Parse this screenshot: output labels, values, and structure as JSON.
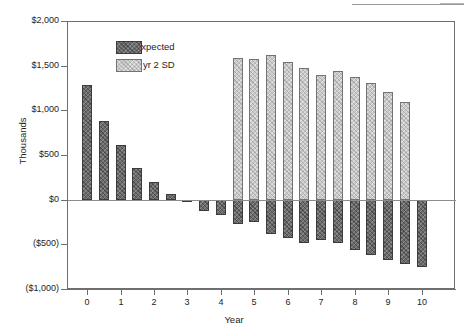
{
  "chart_data": {
    "type": "bar",
    "title": "",
    "xlabel": "Year",
    "ylabel": "Thousands",
    "ylim": [
      -1000,
      2000
    ],
    "xlim": [
      -0.6,
      11.0
    ],
    "grid": false,
    "legend_position": "top-left-inside",
    "y_ticks": [
      2000,
      1500,
      1000,
      500,
      0,
      -500,
      -1000
    ],
    "y_ticklabels": [
      "$2,000",
      "$1,500",
      "$1,000",
      "$500",
      "$0",
      "($500)",
      "($1,000)"
    ],
    "x_ticks": [
      0,
      1,
      2,
      3,
      4,
      5,
      6,
      7,
      8,
      9,
      10
    ],
    "x_ticklabels": [
      "0",
      "1",
      "2",
      "3",
      "4",
      "5",
      "6",
      "7",
      "8",
      "9",
      "10"
    ],
    "bar_width_units": 0.3,
    "series": [
      {
        "name": "Expected",
        "color": "#6b6b6b",
        "edge_color": "#3c3c3c",
        "x": [
          0.0,
          0.5,
          1.0,
          1.5,
          2.0,
          2.5,
          3.0,
          3.5,
          4.0,
          4.5,
          5.0,
          5.5,
          6.0,
          6.5,
          7.0,
          7.5,
          8.0,
          8.5,
          9.0,
          9.5,
          10.0
        ],
        "values": [
          1280,
          880,
          610,
          355,
          195,
          60,
          -25,
          -125,
          -175,
          -275,
          -250,
          -385,
          -430,
          -490,
          -450,
          -480,
          -560,
          -625,
          -670,
          -720,
          -750
        ]
      },
      {
        "name": "4 yr 2 SD",
        "color": "#c9c9c9",
        "edge_color": "#737373",
        "x": [
          4.5,
          5.0,
          5.5,
          6.0,
          6.5,
          7.0,
          7.5,
          8.0,
          8.5,
          9.0,
          9.5
        ],
        "values": [
          1590,
          1580,
          1620,
          1545,
          1475,
          1390,
          1440,
          1370,
          1310,
          1210,
          1090
        ]
      }
    ]
  },
  "legend": {
    "items": [
      {
        "label": "Expected",
        "swatch": "dark-hatched-swatch"
      },
      {
        "label": "4 yr 2 SD",
        "swatch": "light-hatched-swatch"
      }
    ]
  },
  "axes": {
    "y_title": "Thousands",
    "x_title": "Year"
  }
}
